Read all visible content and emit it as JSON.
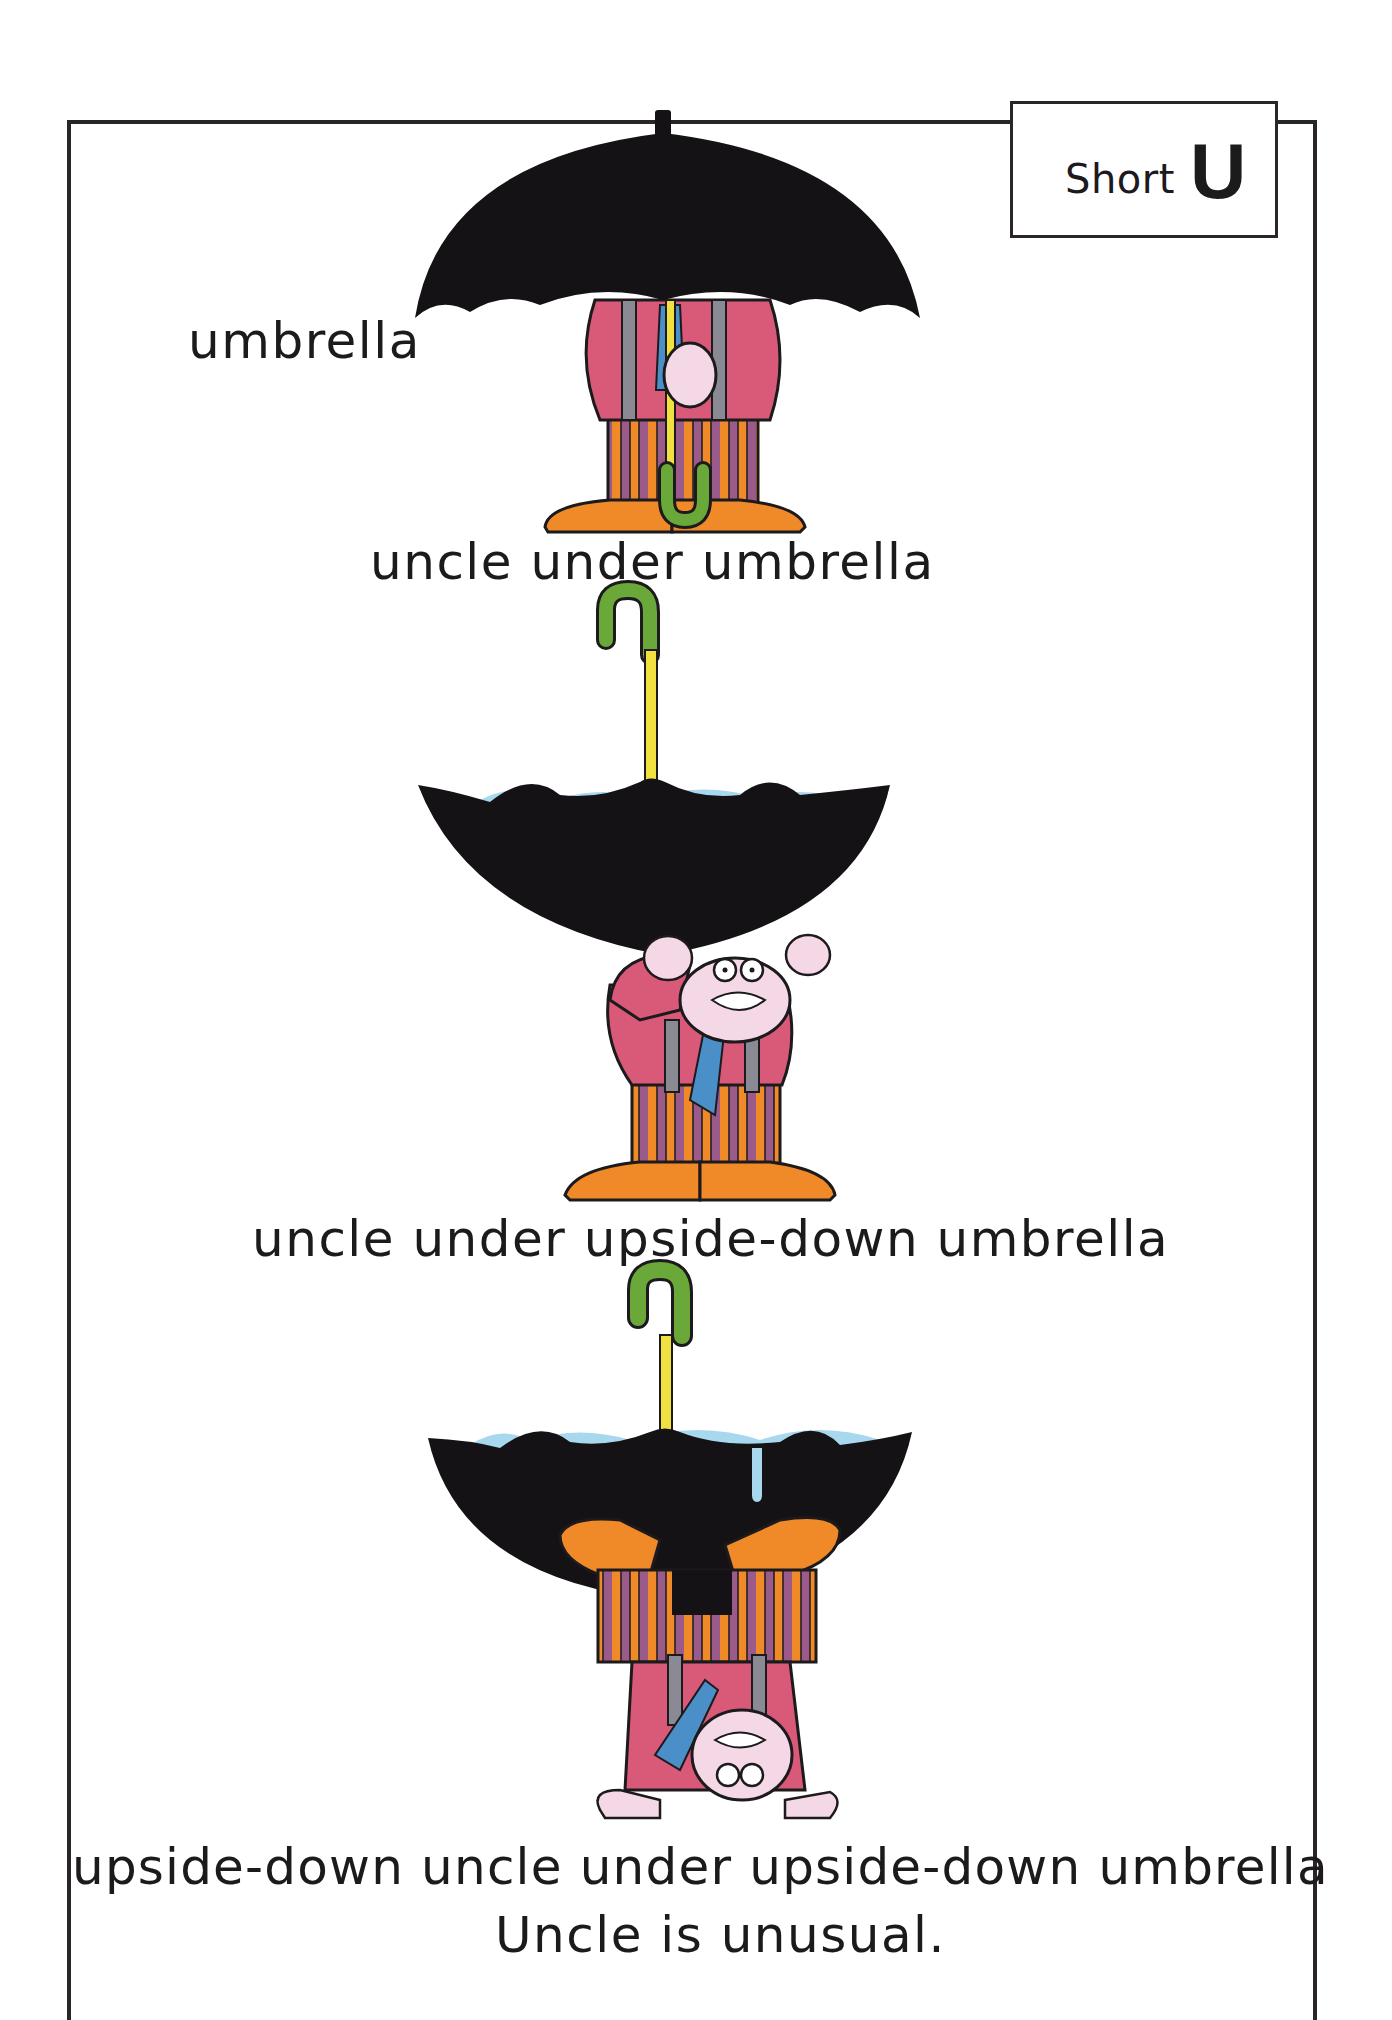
{
  "badge": {
    "word": "Short",
    "letter": "U"
  },
  "captions": {
    "c1": "umbrella",
    "c2": "uncle under umbrella",
    "c3": "uncle under upside-down umbrella",
    "c4": "upside-down uncle under upside-down umbrella",
    "c5": "Uncle is unusual."
  },
  "illustrations": [
    {
      "id": "umbrella-upright-uncle",
      "description": "uncle standing under open black umbrella"
    },
    {
      "id": "umbrella-inverted-uncle",
      "description": "uncle standing under upside-down umbrella holding water"
    },
    {
      "id": "inverted-umbrella-inverted-uncle",
      "description": "upside-down uncle under upside-down umbrella"
    }
  ],
  "colors": {
    "ink": "#1c1a1c",
    "canopy": "#141214",
    "shirt": "#d95a78",
    "suspenders": "#8a8a94",
    "tie": "#4a8fc8",
    "shaft": "#f0e040",
    "skin": "#f4d8e6",
    "orange": "#f08a28",
    "purple": "#9a5a8a",
    "handle": "#6aa83a",
    "water": "#a8d8ee"
  }
}
